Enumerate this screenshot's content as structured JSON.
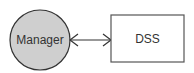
{
  "diagram": {
    "nodes": [
      {
        "id": "manager",
        "label": "Manager",
        "shape": "circle",
        "fill": "#cfcfcf",
        "stroke": "#333333"
      },
      {
        "id": "dss",
        "label": "DSS",
        "shape": "rectangle",
        "fill": "#ffffff",
        "stroke": "#555555"
      }
    ],
    "edges": [
      {
        "from": "manager",
        "to": "dss",
        "direction": "bidirectional",
        "color": "#333333"
      }
    ]
  }
}
